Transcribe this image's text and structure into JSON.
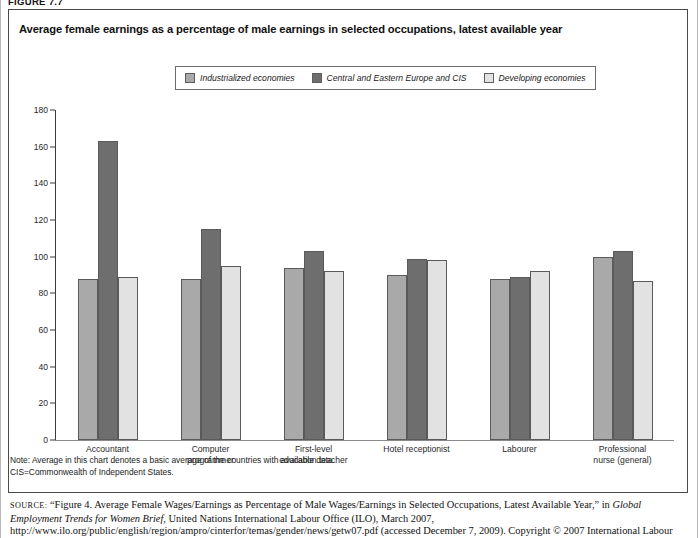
{
  "figure_label": "FIGURE 7.7",
  "chart_title": "Average female earnings as a percentage of male earnings in selected occupations, latest available year",
  "legend": {
    "items": [
      {
        "label": "Industrialized economies",
        "color": "#a9a9a9"
      },
      {
        "label": "Central and Eastern Europe and CIS",
        "color": "#6e6e6e"
      },
      {
        "label": "Developing economies",
        "color": "#e2e2e2"
      }
    ]
  },
  "notes": {
    "line1": "Note: Average in this chart denotes a basic average of the countries with available data.",
    "line2": "CIS=Commonwealth of Independent States."
  },
  "source": {
    "prefix": "SOURCE:",
    "part1": " “Figure 4. Average Female Wages/Earnings as Percentage of Male Wages/Earnings in Selected Occupations, Latest Available Year,” in ",
    "italic_title": "Global Employment Trends for Women Brief",
    "part2": ", United Nations International Labour Office (ILO), March 2007, http://www.ilo.org/public/english/region/ampro/cinterfor/temas/gender/news/getw07.pdf (accessed December 7, 2009). Copyright © 2007 International Labour Organization."
  },
  "chart_data": {
    "type": "bar",
    "title": "Average female earnings as a percentage of male earnings in selected occupations, latest available year",
    "xlabel": "",
    "ylabel": "",
    "ylim": [
      0,
      180
    ],
    "yticks": [
      0,
      20,
      40,
      60,
      80,
      100,
      120,
      140,
      160,
      180
    ],
    "grid": false,
    "legend_position": "top-center",
    "categories": [
      "Accountant",
      "Computer programmer",
      "First-level education teacher",
      "Hotel receptionist",
      "Labourer",
      "Professional nurse (general)"
    ],
    "category_lines": [
      [
        "Accountant"
      ],
      [
        "Computer",
        "programmer"
      ],
      [
        "First-level",
        "education teacher"
      ],
      [
        "Hotel receptionist"
      ],
      [
        "Labourer"
      ],
      [
        "Professional",
        "nurse (general)"
      ]
    ],
    "series": [
      {
        "name": "Industrialized economies",
        "color": "#a9a9a9",
        "values": [
          88,
          88,
          94,
          90,
          88,
          100
        ]
      },
      {
        "name": "Central and Eastern Europe and CIS",
        "color": "#6e6e6e",
        "values": [
          163,
          115,
          103,
          99,
          89,
          103
        ]
      },
      {
        "name": "Developing economies",
        "color": "#e2e2e2",
        "values": [
          89,
          95,
          92,
          98,
          92,
          87
        ]
      }
    ]
  }
}
